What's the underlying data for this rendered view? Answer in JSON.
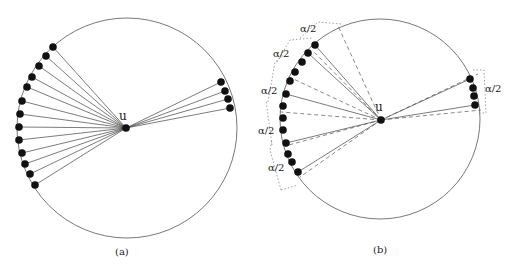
{
  "panels": [
    {
      "id": "a",
      "caption": "(a)",
      "center_label": "u",
      "circle": {
        "cx": 127,
        "cy": 128,
        "r": 110
      },
      "center": {
        "x": 126,
        "y": 128
      },
      "left_points": [
        [
          53,
          47
        ],
        [
          46,
          56
        ],
        [
          39,
          66
        ],
        [
          32,
          77
        ],
        [
          27,
          87
        ],
        [
          22,
          101
        ],
        [
          20,
          114
        ],
        [
          19,
          127
        ],
        [
          19,
          140
        ],
        [
          22,
          153
        ],
        [
          25,
          164
        ],
        [
          30,
          174
        ],
        [
          35,
          185
        ]
      ],
      "right_points": [
        [
          221,
          82
        ],
        [
          225,
          91
        ],
        [
          228,
          99
        ],
        [
          230,
          108
        ]
      ]
    },
    {
      "id": "b",
      "caption": "(b)",
      "center_label": "u",
      "circle": {
        "cx": 380,
        "cy": 119,
        "r": 100
      },
      "center": {
        "x": 381,
        "y": 120
      },
      "left_points": [
        [
          315,
          45
        ],
        [
          308,
          53
        ],
        [
          302,
          62
        ],
        [
          295,
          72
        ],
        [
          290,
          81
        ],
        [
          286,
          94
        ],
        [
          283,
          106
        ],
        [
          283,
          118
        ],
        [
          283,
          130
        ],
        [
          286,
          143
        ],
        [
          288,
          154
        ],
        [
          292,
          162
        ],
        [
          298,
          172
        ]
      ],
      "right_points": [
        [
          470,
          79
        ],
        [
          473,
          88
        ],
        [
          474,
          96
        ],
        [
          475,
          105
        ]
      ],
      "solid_targets": [
        [
          315,
          45
        ],
        [
          308,
          53
        ],
        [
          286,
          94
        ],
        [
          286,
          143
        ],
        [
          298,
          172
        ],
        [
          470,
          79
        ],
        [
          475,
          105
        ]
      ],
      "dashed_targets": [
        [
          338,
          26
        ],
        [
          312,
          50
        ],
        [
          287,
          76
        ],
        [
          281,
          112
        ],
        [
          285,
          146
        ],
        [
          300,
          177
        ],
        [
          478,
          74
        ],
        [
          481,
          110
        ]
      ],
      "angle_labels": [
        {
          "text": "α/2",
          "x": 300,
          "y": 32
        },
        {
          "text": "α/2",
          "x": 273,
          "y": 57
        },
        {
          "text": "α/2",
          "x": 261,
          "y": 94
        },
        {
          "text": "α/2",
          "x": 258,
          "y": 134
        },
        {
          "text": "α/2",
          "x": 268,
          "y": 171
        },
        {
          "text": "α/2",
          "x": 485,
          "y": 92
        }
      ]
    }
  ]
}
